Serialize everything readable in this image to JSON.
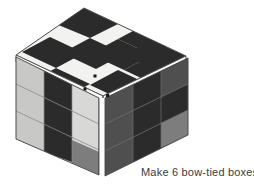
{
  "figure": {
    "caption": "Make 6 bow-tied boxes",
    "background_color": "#ffffff",
    "caption_color": "#3b3b3b"
  },
  "palette": {
    "white_cell": "#f2f2f0",
    "black_cell": "#2b2b2b",
    "light_gray_cell": "#c8c8c6",
    "pale_gray_cell": "#d8d8d6",
    "medium_gray_cell": "#7d7d7d",
    "dark_gray_cell": "#4f4f4f",
    "edge_white": "#ffffff",
    "outline": "#4a4a4a",
    "grid_line": "#8a8a8a",
    "marker_dot": "#151515"
  },
  "cube": {
    "grid_size": 3,
    "faces": [
      {
        "name": "top-face",
        "label": "Top face",
        "cells": [
          [
            "black",
            "white",
            "black"
          ],
          [
            "white",
            "black",
            "white"
          ],
          [
            "black",
            "white",
            "black"
          ]
        ]
      },
      {
        "name": "left-face",
        "label": "Left face",
        "cells": [
          [
            "light_gray",
            "black",
            "pale_gray"
          ],
          [
            "light_gray",
            "black",
            "pale_gray"
          ],
          [
            "light_gray",
            "black",
            "medium_gray"
          ]
        ]
      },
      {
        "name": "right-face",
        "label": "Right face",
        "cells": [
          [
            "dark_gray",
            "black",
            "dark_gray"
          ],
          [
            "dark_gray",
            "black",
            "black"
          ],
          [
            "dark_gray",
            "black",
            "medium_gray"
          ]
        ]
      }
    ],
    "markers": [
      {
        "name": "marker-dot-top-face",
        "face": "top-face",
        "x": 95,
        "y": 76
      },
      {
        "name": "marker-dot-left-face",
        "face": "left-face",
        "x": 85,
        "y": 89
      },
      {
        "name": "marker-dot-right-face",
        "face": "right-face",
        "x": 107,
        "y": 95
      }
    ]
  }
}
